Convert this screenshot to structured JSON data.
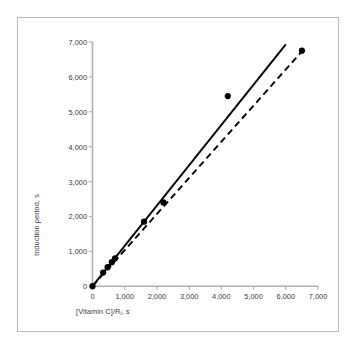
{
  "chart_data": {
    "type": "scatter",
    "title": "",
    "xlabel": "[Vitamin C]/R_i, s",
    "xlabel_main": "[Vitamin C]/R",
    "xlabel_sub": "i",
    "xlabel_tail": ", s",
    "ylabel": "Induction period, s",
    "xlim": [
      0,
      7000
    ],
    "ylim": [
      0,
      7000
    ],
    "grid": false,
    "legend": "none",
    "xticks": [
      0,
      1000,
      2000,
      3000,
      4000,
      5000,
      6000,
      7000
    ],
    "xtick_labels": [
      "0",
      "1,000",
      "2,000",
      "3,000",
      "4,000",
      "5,000",
      "6,000",
      "7,000"
    ],
    "yticks": [
      0,
      1000,
      2000,
      3000,
      4000,
      5000,
      6000,
      7000
    ],
    "ytick_labels": [
      "0",
      "1,000",
      "2,000",
      "3,000",
      "4,000",
      "5,000",
      "6,000",
      "7,000"
    ],
    "points": [
      {
        "x": 0,
        "y": 0
      },
      {
        "x": 330,
        "y": 390
      },
      {
        "x": 470,
        "y": 545
      },
      {
        "x": 600,
        "y": 690
      },
      {
        "x": 700,
        "y": 800
      },
      {
        "x": 1600,
        "y": 1850
      },
      {
        "x": 2200,
        "y": 2400
      },
      {
        "x": 4200,
        "y": 5450
      },
      {
        "x": 6500,
        "y": 6750
      }
    ],
    "series": [
      {
        "name": "solid-fit-line",
        "style": "solid",
        "color": "#000000",
        "x": [
          0,
          6000
        ],
        "y": [
          0,
          6930
        ],
        "slope": 1.155
      },
      {
        "name": "dashed-fit-line",
        "style": "dashed",
        "color": "#000000",
        "x": [
          0,
          6500
        ],
        "y": [
          0,
          6730
        ],
        "slope": 1.035
      }
    ],
    "marker": {
      "shape": "circle",
      "color": "#000000",
      "size": 3.1
    },
    "axis_color": "#b0b0b0",
    "text_color": "#3a3a3a",
    "frame_color": "#b9b9b9",
    "background": "#ffffff"
  }
}
